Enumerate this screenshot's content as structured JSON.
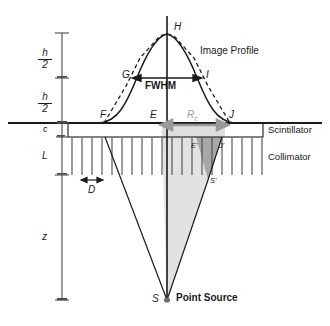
{
  "figure": {
    "colors": {
      "line": "#1a1a1a",
      "gray_arrow": "#9a9a9a",
      "cone_light": "#dcdcdc",
      "cone_dark": "#a8a8a8",
      "septa": "#4a4a4a"
    }
  },
  "axis_labels": {
    "h_half_upper_num": "h",
    "h_half_upper_den": "2",
    "h_half_lower_num": "h",
    "h_half_lower_den": "2",
    "c": "c",
    "L": "L",
    "z": "z"
  },
  "points": {
    "H": "H",
    "G": "G",
    "I": "I",
    "F": "F",
    "E": "E",
    "J": "J",
    "E_prime": "E'",
    "J_prime": "J'",
    "S_prime": "S'",
    "S": "S"
  },
  "annotations": {
    "image_profile": "Image Profile",
    "fwhm": "FWHM",
    "rc_symbol": "R",
    "rc_subscript": "c",
    "septa_pitch": "D",
    "point_source": "Point Source"
  },
  "layers": {
    "scintillator": "Scintillator",
    "collimator": "Collimator"
  },
  "geometry": {
    "peak_x": 167,
    "peak_y": 33,
    "baseline_y": 123,
    "scintillator_bottom_y": 137,
    "collimator_bottom_y": 175,
    "source_y": 300,
    "fwhm_y": 78,
    "box_left_x": 68,
    "box_right_x": 263,
    "F_x": 105,
    "J_x": 228,
    "S_prime_x": 208,
    "E_prime_x": 196,
    "J_prime_x": 222,
    "septa_count": 20,
    "septa_pitch_px": 10
  }
}
